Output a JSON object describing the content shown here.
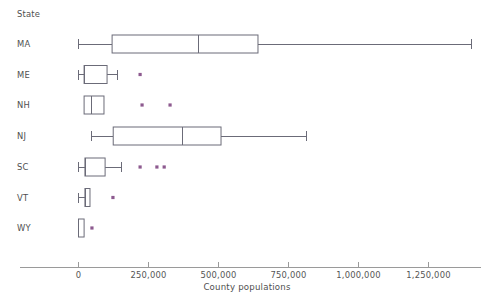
{
  "chart_data": {
    "type": "box",
    "title": "",
    "xlabel": "County populations",
    "ylabel": "State",
    "category_header": "State",
    "categories": [
      "MA",
      "ME",
      "NH",
      "NJ",
      "SC",
      "VT",
      "WY"
    ],
    "xlim": [
      -30000,
      1480000
    ],
    "xticks": [
      0,
      250000,
      500000,
      750000,
      1000000,
      1250000
    ],
    "xtick_labels": [
      "0",
      "250,000",
      "500,000",
      "750,000",
      "1,000,000",
      "1,250,000"
    ],
    "grid": false,
    "legend": null,
    "outlier_color": "#8d5a8f",
    "box_color": "#6b6b78",
    "boxes": [
      {
        "category": "MA",
        "whisker_low": 0,
        "q1": 120000,
        "median": 427000,
        "q3": 641000,
        "whisker_high": 1404000,
        "outliers": []
      },
      {
        "category": "ME",
        "whisker_low": 0,
        "q1": 20000,
        "median": 22000,
        "q3": 102000,
        "whisker_high": 138000,
        "outliers": [
          220000
        ]
      },
      {
        "category": "NH",
        "whisker_low": 20000,
        "q1": 20000,
        "median": 48000,
        "q3": 91000,
        "whisker_high": 91000,
        "outliers": [
          227000,
          327000
        ]
      },
      {
        "category": "NJ",
        "whisker_low": 48000,
        "q1": 124000,
        "median": 370000,
        "q3": 509000,
        "whisker_high": 816000,
        "outliers": []
      },
      {
        "category": "SC",
        "whisker_low": 0,
        "q1": 23000,
        "median": 25000,
        "q3": 95000,
        "whisker_high": 155000,
        "outliers": [
          220000,
          280000,
          306000
        ]
      },
      {
        "category": "VT",
        "whisker_low": 0,
        "q1": 23000,
        "median": 24000,
        "q3": 41000,
        "whisker_high": 41000,
        "outliers": [
          123000
        ]
      },
      {
        "category": "WY",
        "whisker_low": 0,
        "q1": 0,
        "median": 1000,
        "q3": 20000,
        "whisker_high": 20000,
        "outliers": [
          48000
        ]
      }
    ]
  }
}
